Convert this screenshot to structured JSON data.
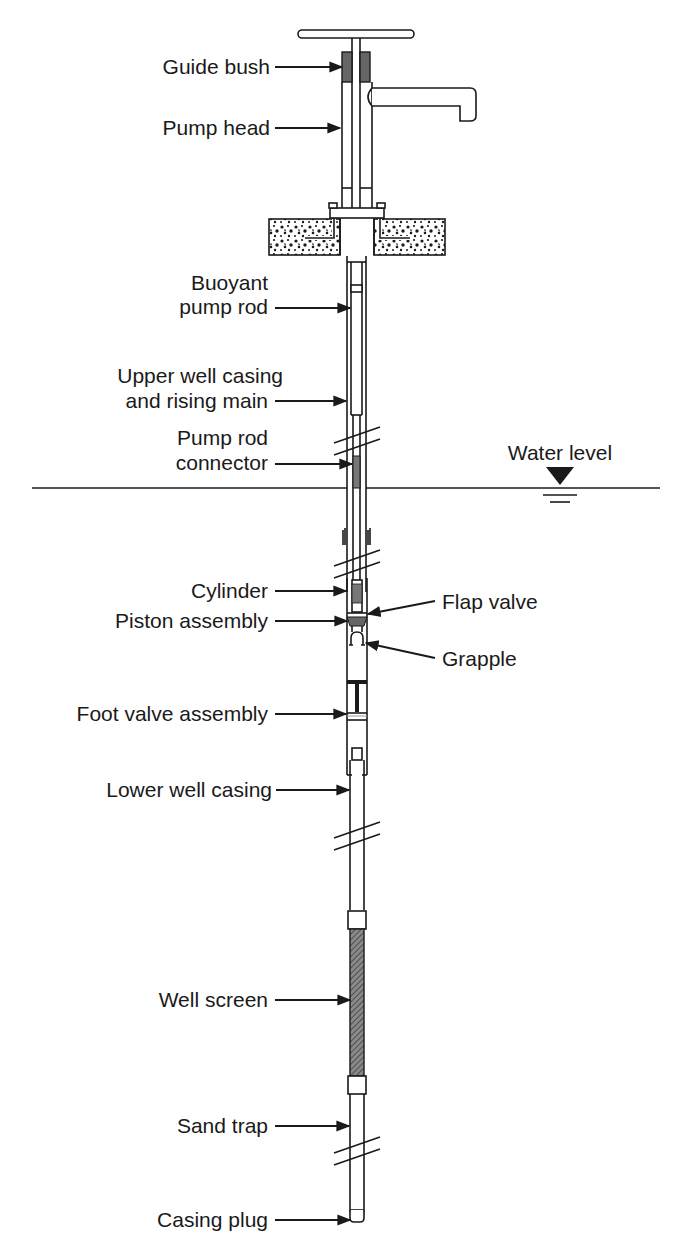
{
  "diagram": {
    "type": "labeled-cross-section",
    "colors": {
      "line": "#1a1a1a",
      "fill_dark": "#555555",
      "background": "#ffffff"
    },
    "water_level_label": "Water level",
    "labels": {
      "guide_bush": "Guide bush",
      "pump_head": "Pump head",
      "buoyant_pump_rod_1": "Buoyant",
      "buoyant_pump_rod_2": "pump rod",
      "upper_casing_1": "Upper well casing",
      "upper_casing_2": "and rising main",
      "pump_rod_connector_1": "Pump rod",
      "pump_rod_connector_2": "connector",
      "cylinder": "Cylinder",
      "piston_assembly": "Piston assembly",
      "flap_valve": "Flap valve",
      "grapple": "Grapple",
      "foot_valve_assembly": "Foot valve assembly",
      "lower_well_casing": "Lower well casing",
      "well_screen": "Well screen",
      "sand_trap": "Sand trap",
      "casing_plug": "Casing plug"
    }
  }
}
